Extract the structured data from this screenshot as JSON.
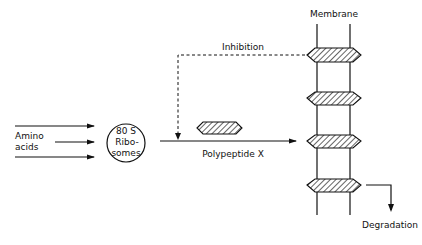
{
  "diagram": {
    "labels": {
      "membrane": "Membrane",
      "inhibition": "Inhibition",
      "amino_line1": "Amino",
      "amino_line2": "acids",
      "ribosome_line1": "80 S",
      "ribosome_line2": "Ribo-",
      "ribosome_line3": "somes",
      "polypeptide": "Polypeptide X",
      "degradation": "Degradation"
    },
    "nodes": [
      {
        "id": "amino-acids",
        "label": "Amino acids"
      },
      {
        "id": "ribosomes",
        "label": "80 S Ribosomes",
        "shape": "circle"
      },
      {
        "id": "polypeptide-x",
        "label": "Polypeptide X",
        "shape": "hatched-hexagon"
      },
      {
        "id": "membrane",
        "label": "Membrane",
        "contains": 4
      },
      {
        "id": "degradation",
        "label": "Degradation"
      }
    ],
    "edges": [
      {
        "from": "amino-acids",
        "to": "ribosomes",
        "count": 3,
        "style": "solid"
      },
      {
        "from": "ribosomes",
        "to": "membrane",
        "label": "Polypeptide X",
        "style": "solid"
      },
      {
        "from": "membrane",
        "to": "ribosomes-output",
        "label": "Inhibition",
        "style": "dashed"
      },
      {
        "from": "membrane",
        "to": "degradation",
        "style": "solid"
      }
    ],
    "colors": {
      "ink": "#111111",
      "background": "#ffffff"
    }
  }
}
